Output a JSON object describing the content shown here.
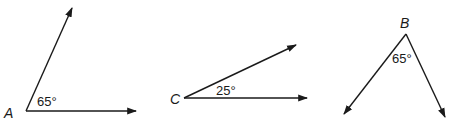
{
  "figure": {
    "stroke_color": "#1a1a1a",
    "background": "#ffffff",
    "angles": [
      {
        "vertex_label": "A",
        "measure": "65°",
        "vertex": [
          26,
          111
        ],
        "rays": [
          [
            72,
            8
          ],
          [
            136,
            111
          ]
        ],
        "vertex_label_pos": [
          4,
          118
        ],
        "measure_pos": [
          37,
          106
        ]
      },
      {
        "vertex_label": "C",
        "measure": "25°",
        "vertex": [
          184,
          98
        ],
        "rays": [
          [
            296,
            45
          ],
          [
            307,
            98
          ]
        ],
        "vertex_label_pos": [
          170,
          104
        ],
        "measure_pos": [
          216,
          95
        ]
      },
      {
        "vertex_label": "B",
        "measure": "65°",
        "vertex": [
          406,
          34
        ],
        "rays": [
          [
            344,
            114
          ],
          [
            445,
            117
          ]
        ],
        "vertex_label_pos": [
          400,
          28
        ],
        "measure_pos": [
          392,
          63
        ]
      }
    ]
  }
}
